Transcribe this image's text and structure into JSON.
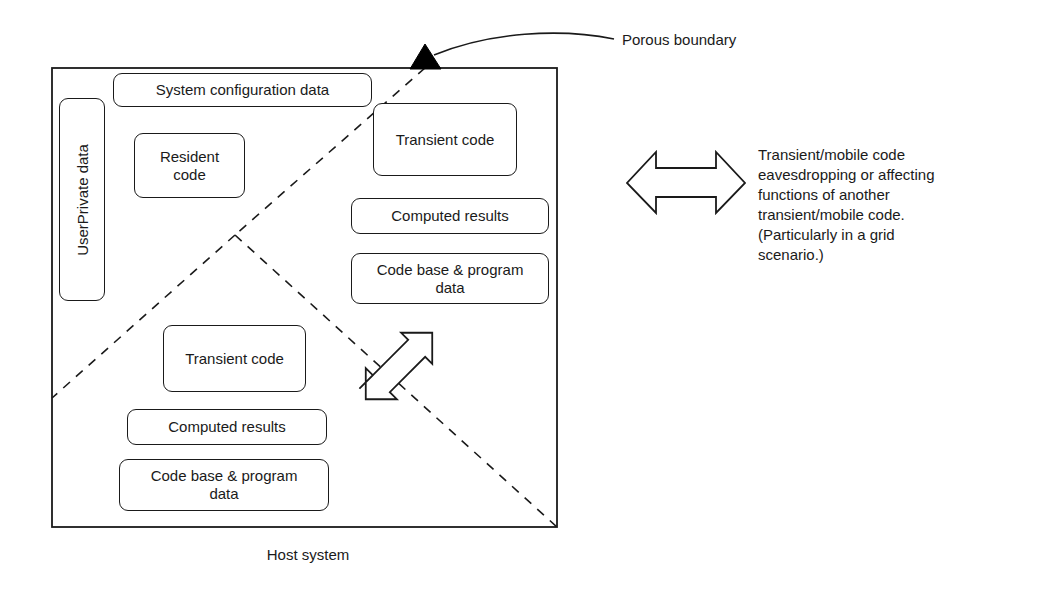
{
  "diagram": {
    "title_caption": "Host system",
    "annotations": {
      "porous_boundary": "Porous boundary",
      "eavesdropping_note": "Transient/mobile code\neavesdropping or affecting\nfunctions of another\ntransient/mobile code.\n(Particularly in a grid\nscenario.)"
    },
    "host_system": {
      "vertical_band": {
        "label": "UserPrivate data"
      },
      "upper_left_region": [
        {
          "label": "System configuration data"
        },
        {
          "label": "Resident\ncode"
        }
      ],
      "upper_right_region": [
        {
          "label": "Transient code"
        },
        {
          "label": "Computed results"
        },
        {
          "label": "Code base & program\ndata"
        }
      ],
      "lower_region": [
        {
          "label": "Transient code"
        },
        {
          "label": "Computed results"
        },
        {
          "label": "Code base & program\ndata"
        }
      ]
    },
    "colors": {
      "stroke": "#1a1a1a",
      "background": "#ffffff",
      "marker_fill": "#000000"
    }
  }
}
